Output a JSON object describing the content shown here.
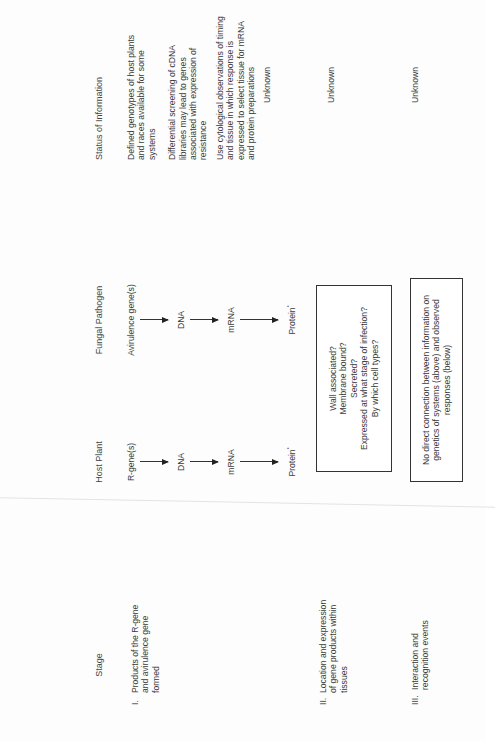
{
  "headers": {
    "stage": "Stage",
    "host_plant": "Host Plant",
    "fungal_pathogen": "Fungal Pathogen",
    "status": "Status of Information"
  },
  "stages": [
    {
      "numeral": "I.",
      "label": "Products of the R-gene and avirulence gene formed"
    },
    {
      "numeral": "II.",
      "label": "Location and expression of gene products within tissues"
    },
    {
      "numeral": "III.",
      "label": "Interaction and recognition events"
    }
  ],
  "host_plant": {
    "gene": "R-gene(s)",
    "dna": "DNA",
    "mrna": "mRNA",
    "protein": "Protein",
    "protein_mark": "*"
  },
  "fungal_pathogen": {
    "gene": "Avirulence gene(s)",
    "dna": "DNA",
    "mrna": "mRNA",
    "protein": "Protein",
    "protein_mark": "*"
  },
  "boxes": {
    "location_questions": [
      "Wall associated?",
      "Membrane bound?",
      "Secreted?",
      "Expressed at what stage of infection?",
      "By which cell types?"
    ],
    "no_connection": "No direct connection between information on genetics of systems (above) and observed responses (below)"
  },
  "status": {
    "stage1": [
      "Defined genotypes of host plants and races available for some systems",
      "Differential screening of cDNA libraries may lead to genes associated with expression of resistance",
      "Use cytological observations of timing and tissue in which response is expressed to select tissue for mRNA and protein preparations",
      "Unknown"
    ],
    "stage2": "Unknown",
    "stage3": "Unknown"
  }
}
